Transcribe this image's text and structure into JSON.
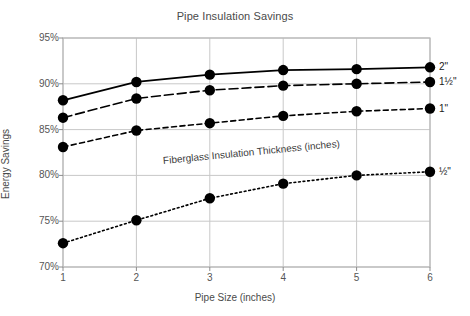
{
  "chart_data": {
    "type": "line",
    "title": "Pipe Insulation Savings",
    "xlabel": "Pipe Size (inches)",
    "ylabel": "Energy Savings",
    "x": [
      1,
      2,
      3,
      4,
      5,
      6
    ],
    "xtick_labels": [
      "1",
      "2",
      "3",
      "4",
      "5",
      "6"
    ],
    "ytick_labels": [
      "95%",
      "90%",
      "85%",
      "80%",
      "75%",
      "70%"
    ],
    "ytick_values": [
      95,
      90,
      85,
      80,
      75,
      70
    ],
    "xlim": [
      1,
      6
    ],
    "ylim": [
      70,
      95
    ],
    "grid": true,
    "legend_position": "right-of-axes",
    "annotation": "Fiberglass Insulation Thickness (inches)",
    "series": [
      {
        "name": "2\"",
        "label": "2\"",
        "line_style": "solid",
        "color": "#000000",
        "values": [
          88.2,
          90.2,
          91.0,
          91.5,
          91.6,
          91.8
        ]
      },
      {
        "name": "1½\"",
        "label": "1½\"",
        "line_style": "dashed",
        "color": "#000000",
        "values": [
          86.3,
          88.4,
          89.3,
          89.8,
          90.0,
          90.2
        ]
      },
      {
        "name": "1\"",
        "label": "1\"",
        "line_style": "dashed-short",
        "color": "#000000",
        "values": [
          83.1,
          84.9,
          85.7,
          86.5,
          87.0,
          87.3
        ]
      },
      {
        "name": "½\"",
        "label": "½\"",
        "line_style": "dotted",
        "color": "#000000",
        "values": [
          72.6,
          75.1,
          77.5,
          79.1,
          80.0,
          80.4
        ]
      }
    ]
  },
  "axes": {
    "frame_color": "#b8b8b8",
    "grid_color": "#c8c8c8"
  }
}
